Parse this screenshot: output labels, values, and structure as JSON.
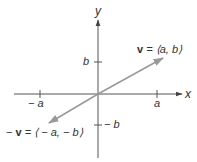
{
  "diagram": {
    "axes": {
      "x_label": "x",
      "y_label": "y",
      "x_ticks": [
        {
          "label": "− a",
          "value": "-a"
        },
        {
          "label": "a",
          "value": "a"
        }
      ],
      "y_ticks": [
        {
          "label": "b",
          "value": "b"
        },
        {
          "label": "− b",
          "value": "-b"
        }
      ]
    },
    "vectors": [
      {
        "name": "v",
        "label_bold": "v",
        "label_rest": " = ⟨a, b⟩",
        "from": [
          0,
          0
        ],
        "to": [
          "a",
          "b"
        ]
      },
      {
        "name": "-v",
        "label_prefix": "− ",
        "label_bold": "v",
        "label_rest": " = ⟨ − a, − b⟩",
        "from": [
          0,
          0
        ],
        "to": [
          "-a",
          "-b"
        ]
      }
    ],
    "colors": {
      "axes": "#444444",
      "vector": "#999999",
      "text": "#333333"
    }
  }
}
